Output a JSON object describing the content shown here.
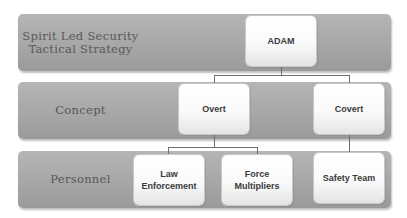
{
  "diagram": {
    "type": "hierarchy",
    "bands": [
      {
        "label": "Spirit Led Security Tactical Strategy"
      },
      {
        "label": "Concept"
      },
      {
        "label": "Personnel"
      }
    ],
    "nodes": {
      "root": "ADAM",
      "overt": "Overt",
      "covert": "Covert",
      "law_enforcement": "Law Enforcement",
      "force_multipliers": "Force Multipliers",
      "safety_team": "Safety Team"
    },
    "edges": [
      [
        "ADAM",
        "Overt"
      ],
      [
        "ADAM",
        "Covert"
      ],
      [
        "Overt",
        "Law Enforcement"
      ],
      [
        "Overt",
        "Force Multipliers"
      ],
      [
        "Covert",
        "Safety Team"
      ]
    ],
    "colors": {
      "band": "#a8a8a8",
      "node": "#ffffff",
      "band_text": "#585858",
      "node_text": "#3a3a3a",
      "connector": "#6e6e6e"
    }
  }
}
